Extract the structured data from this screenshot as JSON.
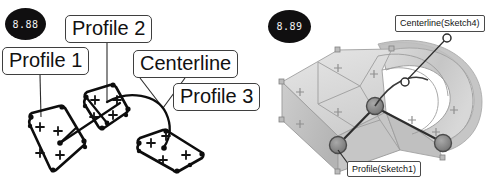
{
  "figure": {
    "title_left": "8.88",
    "title_right": "8.89",
    "kind": "cad-sweep-loft-illustration"
  },
  "left_panel": {
    "badge": "8.88",
    "callouts": [
      {
        "id": "profile1",
        "label": "Profile 1"
      },
      {
        "id": "profile2",
        "label": "Profile 2"
      },
      {
        "id": "centerline",
        "label": "Centerline"
      },
      {
        "id": "profile3",
        "label": "Profile 3"
      }
    ],
    "sketch": {
      "profile_count": 3,
      "centerline_type": "arc",
      "vertex_marker": "filled-dot",
      "construction_marker": "plus"
    }
  },
  "right_panel": {
    "badge": "8.89",
    "callouts": [
      {
        "id": "centerline-sketch4",
        "label": "Centerline(Sketch4)"
      },
      {
        "id": "profile-sketch1",
        "label": "Profile(Sketch1)"
      }
    ],
    "model": {
      "type": "swept-solid",
      "shading": "translucent-gray",
      "handle_count": 3
    }
  },
  "colors": {
    "badge_bg": "#100f10",
    "badge_text": "#f2f2f2",
    "callout_border": "#3f3f3f",
    "ink": "#111111",
    "model_light": "#dedede",
    "model_mid": "#c8c8c8",
    "model_dark": "#b0b0b0",
    "handle_fill": "#8d8d8d",
    "paper": "#ffffff"
  }
}
